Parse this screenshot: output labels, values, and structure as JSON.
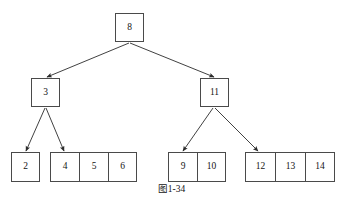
{
  "figure": {
    "caption": "图1-34",
    "background_color": "#ffffff",
    "stroke_color": "#4a4a4a",
    "text_color": "#141414"
  },
  "tree": {
    "root": {
      "label": "8",
      "x": 115,
      "y": 13,
      "w": 29,
      "h": 29
    },
    "internal": [
      {
        "id": "node-3",
        "label": "3",
        "x": 31,
        "y": 78,
        "w": 29,
        "h": 29
      },
      {
        "id": "node-11",
        "label": "11",
        "x": 200,
        "y": 78,
        "w": 29,
        "h": 29
      }
    ],
    "leaf_groups": [
      {
        "id": "leaf-group-1",
        "x": 11,
        "y": 152,
        "cell_w": 29,
        "values": [
          "2"
        ]
      },
      {
        "id": "leaf-group-2",
        "x": 50,
        "y": 152,
        "cell_w": 29,
        "values": [
          "4",
          "5",
          "6"
        ]
      },
      {
        "id": "leaf-group-3",
        "x": 168,
        "y": 152,
        "cell_w": 29,
        "values": [
          "9",
          "10"
        ]
      },
      {
        "id": "leaf-group-4",
        "x": 245,
        "y": 152,
        "cell_w": 30,
        "values": [
          "12",
          "13",
          "14"
        ]
      }
    ],
    "edges": [
      {
        "id": "edge-root-to-3",
        "from": "8",
        "to": "3",
        "x1": 129,
        "y1": 43,
        "x2": 47,
        "y2": 77
      },
      {
        "id": "edge-root-to-11",
        "from": "8",
        "to": "11",
        "x1": 130,
        "y1": 43,
        "x2": 214,
        "y2": 77
      },
      {
        "id": "edge-3-to-2",
        "from": "3",
        "to": "2",
        "x1": 45,
        "y1": 108,
        "x2": 26,
        "y2": 151
      },
      {
        "id": "edge-3-to-4",
        "from": "3",
        "to": "4",
        "x1": 46,
        "y1": 108,
        "x2": 64,
        "y2": 151
      },
      {
        "id": "edge-11-to-9",
        "from": "11",
        "to": "9",
        "x1": 213,
        "y1": 108,
        "x2": 183,
        "y2": 151
      },
      {
        "id": "edge-11-to-12",
        "from": "11",
        "to": "12",
        "x1": 215,
        "y1": 108,
        "x2": 258,
        "y2": 151
      }
    ]
  }
}
